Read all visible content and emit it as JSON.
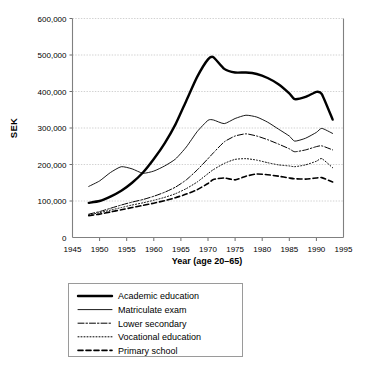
{
  "chart_data": {
    "type": "line",
    "title": "",
    "xlabel": "Year (age 20–65)",
    "ylabel": "SEK",
    "xlim": [
      1945,
      1995
    ],
    "ylim": [
      0,
      600000
    ],
    "grid": true,
    "legend_position": "bottom",
    "xticks": [
      "1945",
      "1950",
      "1955",
      "1960",
      "1965",
      "1970",
      "1975",
      "1980",
      "1985",
      "1990",
      "1995"
    ],
    "xtick_values": [
      1945,
      1950,
      1955,
      1960,
      1965,
      1970,
      1975,
      1980,
      1985,
      1990,
      1995
    ],
    "yticks": [
      "0",
      "100,000",
      "200,000",
      "300,000",
      "400,000",
      "500,000",
      "600,000"
    ],
    "ytick_values": [
      0,
      100000,
      200000,
      300000,
      400000,
      500000,
      600000
    ],
    "x": [
      1948,
      1950,
      1952,
      1954,
      1956,
      1958,
      1960,
      1962,
      1964,
      1966,
      1968,
      1970,
      1971,
      1973,
      1975,
      1977,
      1979,
      1981,
      1983,
      1985,
      1986,
      1988,
      1990,
      1991,
      1993
    ],
    "series": [
      {
        "name": "Academic education",
        "style": "solid-thick",
        "values": [
          95000,
          100000,
          112000,
          128000,
          150000,
          178000,
          215000,
          258000,
          310000,
          375000,
          440000,
          488000,
          494000,
          462000,
          452000,
          452000,
          448000,
          437000,
          420000,
          395000,
          379000,
          385000,
          399000,
          393000,
          323000
        ]
      },
      {
        "name": "Matriculate exam",
        "style": "solid-thin",
        "values": [
          140000,
          155000,
          178000,
          194000,
          188000,
          176000,
          182000,
          196000,
          215000,
          248000,
          290000,
          321000,
          322000,
          312000,
          326000,
          335000,
          330000,
          316000,
          297000,
          278000,
          264000,
          272000,
          288000,
          299000,
          285000
        ]
      },
      {
        "name": "Lower secondary",
        "style": "dashdot",
        "values": [
          64000,
          71000,
          80000,
          89000,
          97000,
          104000,
          113000,
          124000,
          138000,
          158000,
          185000,
          216000,
          232000,
          262000,
          278000,
          284000,
          278000,
          268000,
          256000,
          243000,
          235000,
          240000,
          249000,
          251000,
          240000
        ]
      },
      {
        "name": "Vocational education",
        "style": "dotted",
        "values": [
          62000,
          68000,
          75000,
          82000,
          89000,
          95000,
          102000,
          110000,
          120000,
          134000,
          152000,
          175000,
          186000,
          203000,
          214000,
          216000,
          212000,
          205000,
          199000,
          196000,
          194000,
          199000,
          209000,
          216000,
          191000
        ]
      },
      {
        "name": "Primary school",
        "style": "dashed",
        "values": [
          60000,
          64000,
          70000,
          76000,
          82000,
          88000,
          94000,
          101000,
          109000,
          119000,
          131000,
          148000,
          159000,
          163000,
          158000,
          168000,
          174000,
          172000,
          168000,
          163000,
          161000,
          160000,
          163000,
          164000,
          152000
        ]
      }
    ],
    "legend_entries": [
      {
        "label": "Academic education",
        "style": "solid-thick"
      },
      {
        "label": "Matriculate exam",
        "style": "solid-thin"
      },
      {
        "label": "Lower secondary",
        "style": "dashdot"
      },
      {
        "label": "Vocational education",
        "style": "dotted"
      },
      {
        "label": "Primary school",
        "style": "dashed"
      }
    ]
  }
}
